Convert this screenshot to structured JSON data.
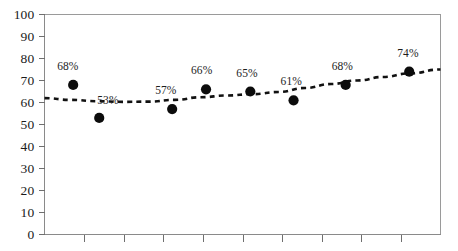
{
  "chart_data": {
    "type": "scatter",
    "title": "",
    "subtitle": "",
    "xlabel": "",
    "ylabel": "",
    "ylim": [
      0,
      100
    ],
    "y_ticks": [
      0,
      10,
      20,
      30,
      40,
      50,
      60,
      70,
      80,
      90,
      100
    ],
    "y_tick_labels": [
      "0",
      "10",
      "20",
      "30",
      "40",
      "50",
      "60",
      "70",
      "80",
      "90",
      "100"
    ],
    "x_tick_labels": [
      "",
      "",
      "",
      "",
      "",
      "",
      "",
      "",
      ""
    ],
    "x_tick_count": 9,
    "grid": false,
    "legend": false,
    "legend_position": "none",
    "marker_style": "filled-circle",
    "marker_color": "#0c0c0c",
    "trendline": {
      "style": "dotted",
      "color": "#111111",
      "label": "",
      "points": [
        {
          "x": 0.0,
          "y": 62.0
        },
        {
          "x": 0.5,
          "y": 61.2
        },
        {
          "x": 1.0,
          "y": 60.6
        },
        {
          "x": 1.5,
          "y": 60.3
        },
        {
          "x": 2.0,
          "y": 60.4
        },
        {
          "x": 2.5,
          "y": 61.2
        },
        {
          "x": 3.0,
          "y": 62.4
        },
        {
          "x": 3.5,
          "y": 63.2
        },
        {
          "x": 4.0,
          "y": 63.8
        },
        {
          "x": 4.5,
          "y": 64.8
        },
        {
          "x": 5.0,
          "y": 66.6
        },
        {
          "x": 5.5,
          "y": 68.4
        },
        {
          "x": 6.0,
          "y": 70.0
        },
        {
          "x": 6.5,
          "y": 71.6
        },
        {
          "x": 7.0,
          "y": 73.2
        },
        {
          "x": 7.6,
          "y": 75.0
        }
      ]
    },
    "series": [
      {
        "name": "",
        "points": [
          {
            "x": 0.55,
            "y": 68,
            "label": "68%",
            "label_dx": -16,
            "label_dy": -25
          },
          {
            "x": 1.05,
            "y": 53,
            "label": "53%",
            "label_dx": -2,
            "label_dy": -24
          },
          {
            "x": 2.45,
            "y": 57,
            "label": "57%",
            "label_dx": -17,
            "label_dy": -25
          },
          {
            "x": 3.1,
            "y": 66,
            "label": "66%",
            "label_dx": -15,
            "label_dy": -25
          },
          {
            "x": 3.95,
            "y": 65,
            "label": "65%",
            "label_dx": -14,
            "label_dy": -25
          },
          {
            "x": 4.78,
            "y": 61,
            "label": "61%",
            "label_dx": -13,
            "label_dy": -25
          },
          {
            "x": 5.78,
            "y": 68,
            "label": "68%",
            "label_dx": -14,
            "label_dy": -25
          },
          {
            "x": 7.0,
            "y": 74,
            "label": "74%",
            "label_dx": -12,
            "label_dy": -25
          }
        ]
      }
    ],
    "categories": [
      "",
      "",
      "",
      "",
      "",
      "",
      "",
      ""
    ],
    "values": [
      68,
      53,
      57,
      66,
      65,
      61,
      68,
      74
    ]
  }
}
